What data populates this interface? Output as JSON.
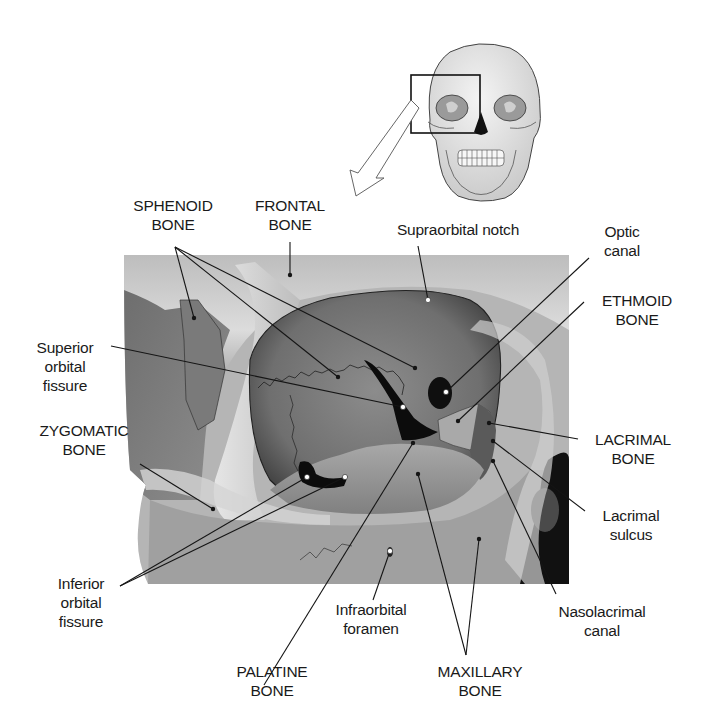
{
  "figure": {
    "inset": {
      "icon": "skull-anterior-icon",
      "note": "Boxed region of right orbit enlarged below",
      "arrow": "callout-arrow-icon"
    }
  },
  "labels": {
    "sphenoid": {
      "line1": "SPHENOID",
      "line2": "BONE"
    },
    "frontal": {
      "line1": "FRONTAL",
      "line2": "BONE"
    },
    "supraorbital_notch": {
      "line1": "Supraorbital notch"
    },
    "optic_canal": {
      "line1": "Optic",
      "line2": "canal"
    },
    "ethmoid": {
      "line1": "ETHMOID",
      "line2": "BONE"
    },
    "superior_orbital_fissure": {
      "line1": "Superior",
      "line2": "orbital",
      "line3": "fissure"
    },
    "zygomatic": {
      "line1": "ZYGOMATIC",
      "line2": "BONE"
    },
    "lacrimal_bone": {
      "line1": "LACRIMAL",
      "line2": "BONE"
    },
    "lacrimal_sulcus": {
      "line1": "Lacrimal",
      "line2": "sulcus"
    },
    "inferior_orbital_fissure": {
      "line1": "Inferior",
      "line2": "orbital",
      "line3": "fissure"
    },
    "infraorbital_foramen": {
      "line1": "Infraorbital",
      "line2": "foramen"
    },
    "nasolacrimal_canal": {
      "line1": "Nasolacrimal",
      "line2": "canal"
    },
    "palatine": {
      "line1": "PALATINE",
      "line2": "BONE"
    },
    "maxillary": {
      "line1": "MAXILLARY",
      "line2": "BONE"
    }
  },
  "colors": {
    "background": "#ffffff",
    "text": "#1a1a1a",
    "leader": "#151515",
    "bone_light": "#d9d9d9",
    "bone_mid": "#9a9a9a",
    "bone_dark": "#5e5e5e",
    "cavity": "#0c0c0c"
  }
}
